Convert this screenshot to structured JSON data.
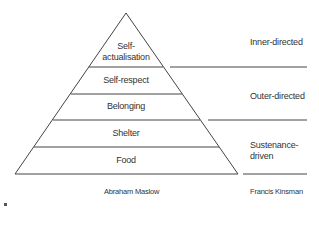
{
  "diagram": {
    "pyramid_levels": [
      {
        "label_line1": "Self-",
        "label_line2": "actualisation"
      },
      {
        "label": "Self-respect"
      },
      {
        "label": "Belonging"
      },
      {
        "label": "Shelter"
      },
      {
        "label": "Food"
      }
    ],
    "right_categories": [
      {
        "label": "Inner-directed"
      },
      {
        "label": "Outer-directed"
      },
      {
        "label_line1": "Sustenance-",
        "label_line2": "driven"
      }
    ],
    "captions": {
      "left": "Abraham Maslow",
      "right": "Francis Kinsman"
    },
    "colors": {
      "line": "#444444",
      "text": "#333333",
      "background": "#ffffff"
    }
  }
}
